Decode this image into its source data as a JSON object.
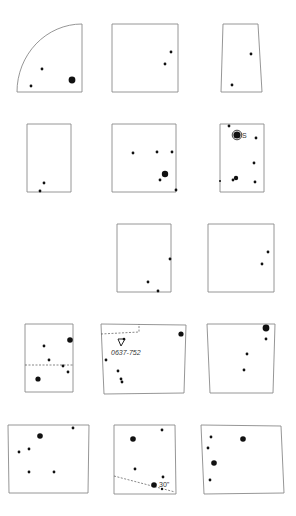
{
  "figure": {
    "stroke_color": "#8a8a8a",
    "dot_color": "#111111",
    "panels": [
      {
        "id": "r1c1",
        "shape": "quarter",
        "points": [
          [
            17,
            85
          ],
          [
            31,
            70
          ],
          [
            31,
            100
          ],
          [
            43,
            80
          ]
        ],
        "dots": [
          [
            42,
            69,
            1.4
          ],
          [
            31,
            86,
            1.4
          ],
          [
            72,
            80,
            3.4
          ]
        ]
      },
      {
        "id": "r1c2",
        "shape": "poly",
        "points": [
          [
            112,
            24
          ],
          [
            178,
            24
          ],
          [
            178,
            92
          ],
          [
            112,
            92
          ]
        ],
        "dots": [
          [
            171,
            52,
            1.4
          ],
          [
            165,
            64,
            1.4
          ]
        ]
      },
      {
        "id": "r1c3",
        "shape": "poly",
        "points": [
          [
            223,
            24
          ],
          [
            258,
            24
          ],
          [
            262,
            92
          ],
          [
            221,
            92
          ]
        ],
        "dots": [
          [
            251,
            54,
            1.4
          ],
          [
            232,
            85,
            1.4
          ]
        ]
      },
      {
        "id": "r2c1",
        "shape": "poly",
        "points": [
          [
            27,
            124
          ],
          [
            71,
            124
          ],
          [
            71,
            192
          ],
          [
            27,
            192
          ]
        ],
        "dots": [
          [
            44,
            183,
            1.4
          ],
          [
            40,
            191,
            1.4
          ]
        ]
      },
      {
        "id": "r2c2",
        "shape": "poly",
        "points": [
          [
            112,
            124
          ],
          [
            176,
            124
          ],
          [
            176,
            192
          ],
          [
            112,
            192
          ]
        ],
        "dots": [
          [
            133,
            153,
            1.4
          ],
          [
            157,
            152,
            1.4
          ],
          [
            172,
            152,
            1.4
          ],
          [
            165,
            174,
            3.2
          ],
          [
            160,
            180,
            1.4
          ],
          [
            176,
            190,
            1.4
          ]
        ]
      },
      {
        "id": "r2c3",
        "shape": "poly",
        "points": [
          [
            220,
            124
          ],
          [
            264,
            124
          ],
          [
            264,
            192
          ],
          [
            220,
            192
          ]
        ],
        "dots": [
          [
            229,
            126,
            1.4
          ],
          [
            237,
            135,
            3.6
          ],
          [
            256,
            138,
            1.4
          ],
          [
            254,
            163,
            1.4
          ],
          [
            236,
            178,
            2.2
          ],
          [
            233,
            180,
            1.4
          ],
          [
            255,
            182,
            1.4
          ],
          [
            220,
            181,
            1
          ]
        ],
        "circled_dot": [
          237,
          135
        ],
        "label": {
          "text": "S",
          "x": 242,
          "y": 138
        }
      },
      {
        "id": "r3c2",
        "shape": "poly",
        "points": [
          [
            117,
            224
          ],
          [
            171,
            224
          ],
          [
            171,
            292
          ],
          [
            117,
            292
          ]
        ],
        "dots": [
          [
            170,
            259,
            1.4
          ],
          [
            148,
            282,
            1.4
          ],
          [
            158,
            291,
            1.4
          ]
        ]
      },
      {
        "id": "r3c3",
        "shape": "poly",
        "points": [
          [
            208,
            224
          ],
          [
            274,
            224
          ],
          [
            274,
            292
          ],
          [
            208,
            292
          ]
        ],
        "dots": [
          [
            268,
            252,
            1.4
          ],
          [
            262,
            264,
            1.4
          ]
        ]
      },
      {
        "id": "r4c1",
        "shape": "poly",
        "points": [
          [
            25,
            324
          ],
          [
            73,
            324
          ],
          [
            73,
            392
          ],
          [
            25,
            392
          ]
        ],
        "dots": [
          [
            70,
            340,
            2.8
          ],
          [
            44,
            346,
            1.4
          ],
          [
            49,
            360,
            1.4
          ],
          [
            63,
            366,
            1.4
          ],
          [
            68,
            372,
            1.4
          ],
          [
            38,
            379,
            2.6
          ]
        ],
        "dashed": [
          [
            25,
            365
          ],
          [
            73,
            365
          ]
        ]
      },
      {
        "id": "r4c2",
        "shape": "poly",
        "points": [
          [
            101,
            324
          ],
          [
            186,
            325
          ],
          [
            184,
            393
          ],
          [
            104,
            394
          ]
        ],
        "dots": [
          [
            181,
            334,
            2.6
          ],
          [
            106,
            360,
            1.4
          ],
          [
            118,
            371,
            1.4
          ],
          [
            121,
            379,
            1.4
          ],
          [
            122,
            382,
            1.4
          ]
        ],
        "dashed_box": [
          [
            101,
            334
          ],
          [
            139,
            332
          ],
          [
            139,
            324
          ]
        ],
        "marker": {
          "x": 122,
          "y": 342
        },
        "label": {
          "text": "0637-752",
          "x": 111,
          "y": 355
        }
      },
      {
        "id": "r4c3",
        "shape": "poly",
        "points": [
          [
            207,
            324
          ],
          [
            275,
            324
          ],
          [
            273,
            393
          ],
          [
            210,
            393
          ]
        ],
        "dots": [
          [
            266,
            328,
            3.4
          ],
          [
            266,
            339,
            1.4
          ],
          [
            247,
            354,
            1.4
          ],
          [
            244,
            370,
            1.4
          ]
        ]
      },
      {
        "id": "r5c1",
        "shape": "poly",
        "points": [
          [
            8,
            425
          ],
          [
            89,
            425
          ],
          [
            88,
            493
          ],
          [
            9,
            493
          ]
        ],
        "dots": [
          [
            73,
            428,
            1.4
          ],
          [
            40,
            436,
            2.8
          ],
          [
            29,
            449,
            1.4
          ],
          [
            19,
            452,
            1.4
          ],
          [
            29,
            472,
            1.4
          ],
          [
            54,
            472,
            1.4
          ]
        ]
      },
      {
        "id": "r5c2",
        "shape": "poly",
        "points": [
          [
            114,
            425
          ],
          [
            175,
            425
          ],
          [
            176,
            494
          ],
          [
            114,
            494
          ]
        ],
        "dots": [
          [
            162,
            430,
            1.4
          ],
          [
            133,
            439,
            2.8
          ],
          [
            135,
            469,
            1.4
          ],
          [
            163,
            477,
            1.4
          ],
          [
            154,
            485,
            2.8
          ],
          [
            162,
            489,
            1.2
          ]
        ],
        "dashed": [
          [
            114,
            476
          ],
          [
            175,
            492
          ]
        ],
        "label": {
          "text": "30\"",
          "x": 159,
          "y": 487
        }
      },
      {
        "id": "r5c3",
        "shape": "poly",
        "points": [
          [
            201,
            425
          ],
          [
            281,
            426
          ],
          [
            284,
            493
          ],
          [
            204,
            494
          ]
        ],
        "dots": [
          [
            211,
            437,
            1.4
          ],
          [
            243,
            439,
            2.8
          ],
          [
            208,
            448,
            1.4
          ],
          [
            214,
            463,
            2.8
          ],
          [
            210,
            480,
            1.4
          ]
        ]
      }
    ]
  }
}
